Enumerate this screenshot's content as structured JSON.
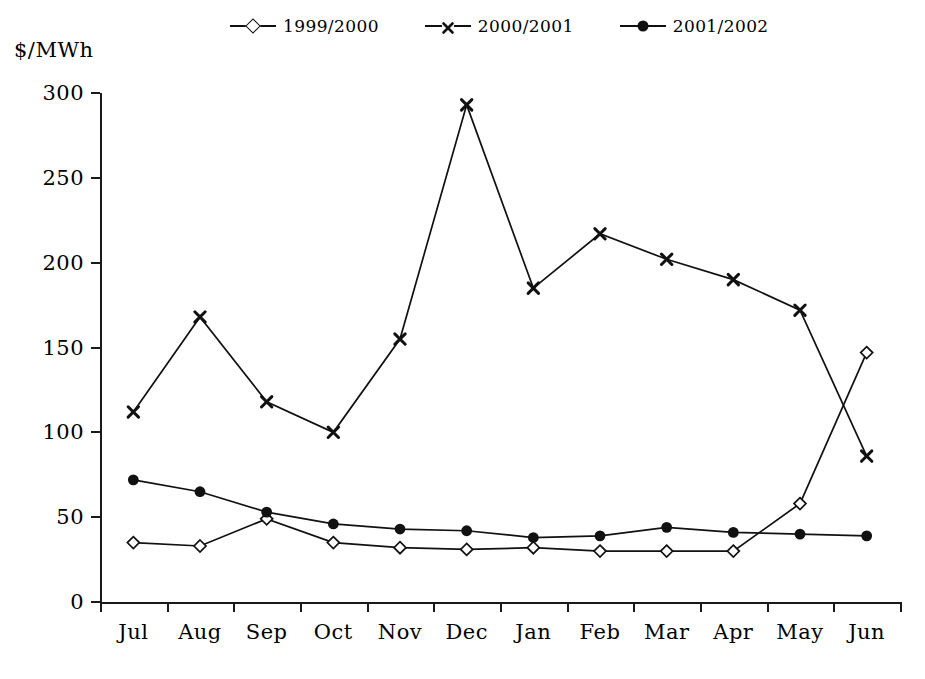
{
  "chart_data": {
    "type": "line",
    "title": "",
    "xlabel": "",
    "ylabel": "$/MWh",
    "ylim": [
      0,
      300
    ],
    "yticks": [
      0,
      50,
      100,
      150,
      200,
      250,
      300
    ],
    "grid": false,
    "legend_position": "top-center",
    "categories": [
      "Jul",
      "Aug",
      "Sep",
      "Oct",
      "Nov",
      "Dec",
      "Jan",
      "Feb",
      "Mar",
      "Apr",
      "May",
      "Jun"
    ],
    "series": [
      {
        "name": "1999/2000",
        "marker": "open-diamond",
        "values": [
          35,
          33,
          49,
          35,
          32,
          31,
          32,
          30,
          30,
          30,
          58,
          147
        ]
      },
      {
        "name": "2000/2001",
        "marker": "x",
        "values": [
          112,
          168,
          118,
          100,
          155,
          293,
          185,
          217,
          202,
          190,
          172,
          86
        ]
      },
      {
        "name": "2001/2002",
        "marker": "filled-circle",
        "values": [
          72,
          65,
          53,
          46,
          43,
          42,
          38,
          39,
          44,
          41,
          40,
          39
        ]
      }
    ]
  },
  "axis": {
    "unit_label": "$/MWh",
    "y_tick_labels": [
      "300",
      "250",
      "200",
      "150",
      "100",
      "50",
      "0"
    ],
    "x_tick_labels": [
      "Jul",
      "Aug",
      "Sep",
      "Oct",
      "Nov",
      "Dec",
      "Jan",
      "Feb",
      "Mar",
      "Apr",
      "May",
      "Jun"
    ]
  },
  "legend": {
    "items": [
      {
        "label": "1999/2000",
        "marker": "open-diamond",
        "line": "solid"
      },
      {
        "label": "2000/2001",
        "marker": "x",
        "line": "dashed"
      },
      {
        "label": "2001/2002",
        "marker": "filled-circle",
        "line": "solid"
      }
    ]
  },
  "colors": {
    "ink": "#111111",
    "background": "#ffffff"
  }
}
